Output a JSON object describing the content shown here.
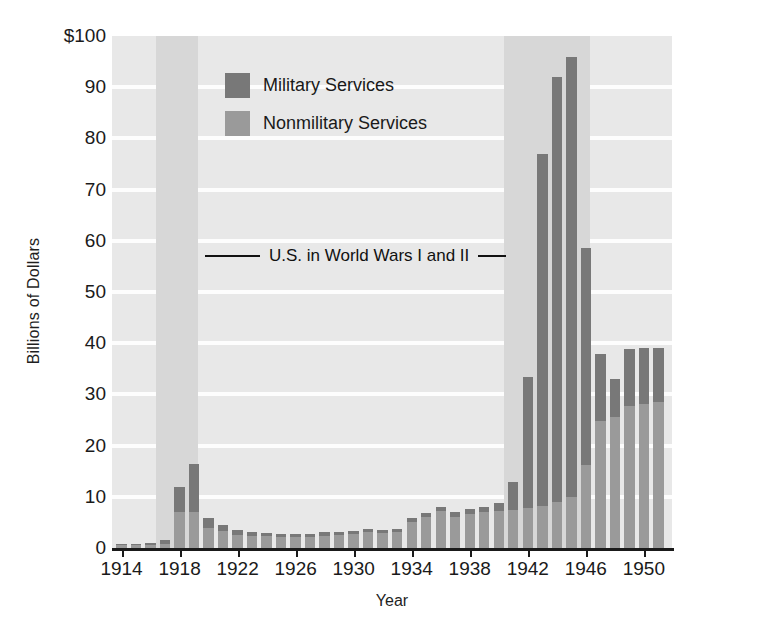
{
  "chart_data": {
    "type": "bar",
    "subtype": "stacked-bar",
    "title": "",
    "xlabel": "Year",
    "ylabel": "Billions of Dollars",
    "ylim": [
      0,
      100
    ],
    "ytick_labels": [
      "$100",
      "90",
      "80",
      "70",
      "60",
      "50",
      "40",
      "30",
      "20",
      "10",
      "0"
    ],
    "ytick_values": [
      100,
      90,
      80,
      70,
      60,
      50,
      40,
      30,
      20,
      10,
      0
    ],
    "xtick_labels": [
      "1914",
      "1918",
      "1922",
      "1926",
      "1930",
      "1934",
      "1938",
      "1942",
      "1946",
      "1950"
    ],
    "xtick_values": [
      1914,
      1918,
      1922,
      1926,
      1930,
      1934,
      1938,
      1942,
      1946,
      1950
    ],
    "grid": "horizontal",
    "legend_position": "upper-left-inside",
    "x": [
      1914,
      1915,
      1916,
      1917,
      1918,
      1919,
      1920,
      1921,
      1922,
      1923,
      1924,
      1925,
      1926,
      1927,
      1928,
      1929,
      1930,
      1931,
      1932,
      1933,
      1934,
      1935,
      1936,
      1937,
      1938,
      1939,
      1940,
      1941,
      1942,
      1943,
      1944,
      1945,
      1946,
      1947,
      1948,
      1949,
      1950,
      1951
    ],
    "series": [
      {
        "name": "Nonmilitary Services",
        "color": "#9a9a9a",
        "values": [
          0.5,
          0.5,
          0.6,
          0.7,
          7.0,
          7.0,
          4.0,
          3.4,
          2.6,
          2.4,
          2.4,
          2.1,
          2.1,
          2.2,
          2.4,
          2.5,
          2.7,
          3.1,
          2.9,
          3.2,
          5.1,
          6.0,
          7.2,
          6.1,
          6.6,
          7.0,
          7.2,
          7.5,
          7.9,
          8.3,
          9.0,
          10.0,
          16.2,
          24.8,
          25.6,
          27.8,
          28.2,
          28.5
        ]
      },
      {
        "name": "Military Services",
        "color": "#787878",
        "values": [
          0.3,
          0.3,
          0.4,
          0.8,
          5.0,
          9.4,
          1.9,
          1.1,
          0.9,
          0.7,
          0.6,
          0.6,
          0.6,
          0.6,
          0.7,
          0.7,
          0.7,
          0.7,
          0.7,
          0.6,
          0.7,
          0.9,
          0.9,
          0.9,
          1.0,
          1.1,
          1.5,
          5.4,
          25.5,
          68.7,
          83.0,
          86.0,
          42.4,
          13.1,
          7.5,
          11.1,
          10.9,
          10.5
        ]
      }
    ],
    "totals": [
      0.8,
      0.8,
      1.0,
      1.5,
      12.0,
      16.4,
      5.9,
      4.5,
      3.5,
      3.1,
      3.0,
      2.7,
      2.7,
      2.8,
      3.1,
      3.2,
      3.4,
      3.8,
      3.6,
      3.8,
      5.8,
      6.9,
      8.1,
      7.0,
      7.6,
      8.1,
      8.7,
      13.0,
      33.4,
      77.0,
      92.0,
      96.0,
      58.6,
      37.9,
      33.1,
      38.9,
      39.1,
      39.0
    ],
    "annotations": [
      {
        "name": "war-period-annotation",
        "text": "U.S. in World Wars I and II",
        "style": "horizontal rules left and right of text"
      }
    ],
    "shaded_bands": [
      {
        "name": "World War I",
        "start": 1917,
        "end": 1919,
        "color": "#d7d7d7"
      },
      {
        "name": "World War II",
        "start": 1941,
        "end": 1946,
        "color": "#d7d7d7"
      }
    ],
    "colors": {
      "plot_background": "#e8e8e8",
      "band": "#d7d7d7",
      "gridline": "#fdfdfd",
      "axis": "#1a1a1a",
      "military": "#787878",
      "nonmilitary": "#9a9a9a"
    }
  },
  "legend": {
    "items": [
      {
        "label": "Military Services",
        "color": "#787878"
      },
      {
        "label": "Nonmilitary Services",
        "color": "#9a9a9a"
      }
    ]
  }
}
